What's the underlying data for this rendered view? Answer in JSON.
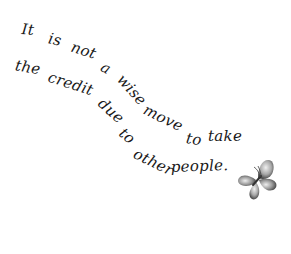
{
  "quote": {
    "full_text": "It is not a wise move to take the credit due to other people.",
    "line1": [
      {
        "text": "It",
        "x": 21,
        "y": 34,
        "rot": 5
      },
      {
        "text": "is",
        "x": 47,
        "y": 43,
        "rot": 12
      },
      {
        "text": "not",
        "x": 69,
        "y": 51,
        "rot": 18
      },
      {
        "text": "a",
        "x": 98,
        "y": 70,
        "rot": 28
      },
      {
        "text": "wise",
        "x": 114,
        "y": 79,
        "rot": 48
      },
      {
        "text": "move",
        "x": 141,
        "y": 113,
        "rot": 26
      },
      {
        "text": "to",
        "x": 185,
        "y": 143,
        "rot": 8
      },
      {
        "text": "take",
        "x": 208,
        "y": 141,
        "rot": 0
      }
    ],
    "line2": [
      {
        "text": "the",
        "x": 14,
        "y": 70,
        "rot": 10
      },
      {
        "text": "credit",
        "x": 46,
        "y": 81,
        "rot": 18
      },
      {
        "text": "due",
        "x": 95,
        "y": 104,
        "rot": 42
      },
      {
        "text": "to",
        "x": 116,
        "y": 134,
        "rot": 40
      },
      {
        "text": "other",
        "x": 131,
        "y": 157,
        "rot": 26
      },
      {
        "text": "people.",
        "x": 171,
        "y": 172,
        "rot": -2
      }
    ]
  },
  "decoration": {
    "icon": "butterfly-icon",
    "color_light": "#d8d8d8",
    "color_dark": "#555555"
  },
  "colors": {
    "background": "#ffffff",
    "text": "#1a1a1a"
  }
}
